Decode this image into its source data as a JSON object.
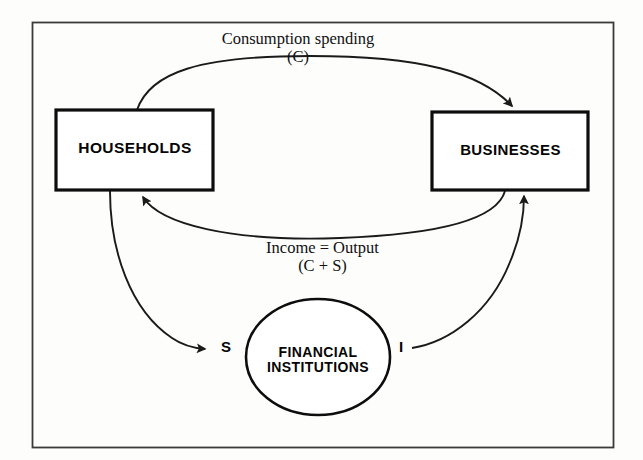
{
  "figure": {
    "name": "circular-flow-diagram",
    "border_color": "#3a3a3a",
    "background_color": "#fdfdfc",
    "stroke_color": "#1a1a1a"
  },
  "nodes": {
    "households": {
      "label": "HOUSEHOLDS",
      "shape": "rectangle"
    },
    "businesses": {
      "label": "BUSINESSES",
      "shape": "rectangle"
    },
    "financial": {
      "label_line1": "FINANCIAL",
      "label_line2": "INSTITUTIONS",
      "shape": "ellipse"
    }
  },
  "flows": {
    "consumption": {
      "line1": "Consumption spending",
      "line2": "(C)"
    },
    "income": {
      "line1": "Income = Output",
      "line2": "(C + S)"
    },
    "savings": {
      "letter": "S"
    },
    "investment": {
      "letter": "I"
    }
  }
}
